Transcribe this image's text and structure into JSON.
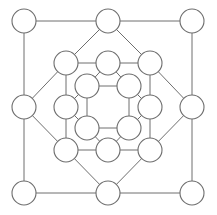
{
  "diagram": {
    "type": "graph",
    "colors": {
      "background": "#ffffff",
      "stroke": "#6e6e6e",
      "node_fill": "#ffffff"
    },
    "node_radius": 12,
    "nodes": [
      {
        "id": "o1",
        "x": 24,
        "y": 21
      },
      {
        "id": "o2",
        "x": 108,
        "y": 21
      },
      {
        "id": "o3",
        "x": 192,
        "y": 21
      },
      {
        "id": "o4",
        "x": 24,
        "y": 107
      },
      {
        "id": "o5",
        "x": 192,
        "y": 107
      },
      {
        "id": "o6",
        "x": 24,
        "y": 193
      },
      {
        "id": "o7",
        "x": 108,
        "y": 193
      },
      {
        "id": "o8",
        "x": 192,
        "y": 193
      },
      {
        "id": "m1",
        "x": 66,
        "y": 63
      },
      {
        "id": "m2",
        "x": 108,
        "y": 63
      },
      {
        "id": "m3",
        "x": 150,
        "y": 63
      },
      {
        "id": "m4",
        "x": 66,
        "y": 107
      },
      {
        "id": "m5",
        "x": 150,
        "y": 107
      },
      {
        "id": "m6",
        "x": 66,
        "y": 150
      },
      {
        "id": "m7",
        "x": 108,
        "y": 150
      },
      {
        "id": "m8",
        "x": 150,
        "y": 150
      },
      {
        "id": "i1",
        "x": 87,
        "y": 86
      },
      {
        "id": "i2",
        "x": 129,
        "y": 86
      },
      {
        "id": "i3",
        "x": 87,
        "y": 128
      },
      {
        "id": "i4",
        "x": 129,
        "y": 128
      }
    ],
    "edges": [
      [
        "o1",
        "o2"
      ],
      [
        "o2",
        "o3"
      ],
      [
        "o3",
        "o5"
      ],
      [
        "o5",
        "o8"
      ],
      [
        "o8",
        "o7"
      ],
      [
        "o7",
        "o6"
      ],
      [
        "o6",
        "o4"
      ],
      [
        "o4",
        "o1"
      ],
      [
        "o2",
        "m1"
      ],
      [
        "o2",
        "m3"
      ],
      [
        "o4",
        "m1"
      ],
      [
        "o4",
        "m6"
      ],
      [
        "o5",
        "m3"
      ],
      [
        "o5",
        "m8"
      ],
      [
        "o7",
        "m6"
      ],
      [
        "o7",
        "m8"
      ],
      [
        "m1",
        "m2"
      ],
      [
        "m2",
        "m3"
      ],
      [
        "m3",
        "m5"
      ],
      [
        "m5",
        "m8"
      ],
      [
        "m8",
        "m7"
      ],
      [
        "m7",
        "m6"
      ],
      [
        "m6",
        "m4"
      ],
      [
        "m4",
        "m1"
      ],
      [
        "i1",
        "i2"
      ],
      [
        "i2",
        "i4"
      ],
      [
        "i4",
        "i3"
      ],
      [
        "i3",
        "i1"
      ],
      [
        "m2",
        "i1"
      ],
      [
        "m2",
        "i2"
      ],
      [
        "m4",
        "i1"
      ],
      [
        "m4",
        "i3"
      ],
      [
        "m5",
        "i2"
      ],
      [
        "m5",
        "i4"
      ],
      [
        "m7",
        "i3"
      ],
      [
        "m7",
        "i4"
      ]
    ]
  }
}
